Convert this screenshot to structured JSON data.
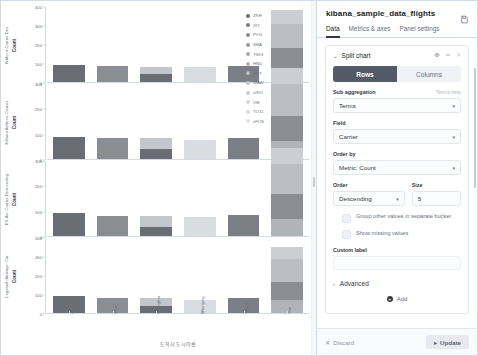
{
  "editor": {
    "title": "kibana_sample_data_flights",
    "save_icon": "save-icon",
    "tabs": [
      {
        "label": "Data",
        "selected": true
      },
      {
        "label": "Metrics & axes",
        "selected": false
      },
      {
        "label": "Panel settings",
        "selected": false
      }
    ],
    "agg": {
      "chevron": "⌄",
      "title": "Split chart",
      "eye_icon": "eye-icon",
      "drag_icon": "drag-handle-icon",
      "close_icon": "close-icon",
      "toggle": {
        "rows": "Rows",
        "columns": "Columns",
        "selected": "Rows"
      },
      "sub_aggregation": {
        "label": "Sub aggregation",
        "help": "Terms help",
        "value": "Terms"
      },
      "field": {
        "label": "Field",
        "value": "Carrier"
      },
      "order_by": {
        "label": "Order by",
        "value": "Metric: Count"
      },
      "order": {
        "label": "Order",
        "value": "Descending"
      },
      "size": {
        "label": "Size",
        "value": "5"
      },
      "group_other": "Group other values in separate bucket",
      "show_missing": "Show missing values",
      "custom_label": "Custom label",
      "custom_label_value": "",
      "advanced": "Advanced",
      "add": "Add"
    },
    "footer": {
      "discard": "Discard",
      "update": "Update"
    }
  },
  "chart_data": {
    "type": "bar",
    "title": "",
    "stacked": true,
    "grid": false,
    "legend_position": "right",
    "xlabel": "도착지 도시이름",
    "ylabel": "Count",
    "categories": [
      "Zurich",
      "Xi'an",
      "Shanghai",
      "Winnipeg",
      "Tokyo",
      "Yee"
    ],
    "legend": [
      {
        "label": "ZRH",
        "color": "#6a6d74"
      },
      {
        "label": "XIY",
        "color": "#7b7e85"
      },
      {
        "label": "PVG",
        "color": "#8a8d94"
      },
      {
        "label": "SHA",
        "color": "#989ba2"
      },
      {
        "label": "YWG",
        "color": "#a5a8af"
      },
      {
        "label": "HND",
        "color": "#b0b3b9"
      },
      {
        "label": "NRT",
        "color": "#babdc3"
      },
      {
        "label": "WAW",
        "color": "#c3c6cb"
      },
      {
        "label": "vRIO",
        "color": "#cbced3"
      },
      {
        "label": "VIE",
        "color": "#d2d5da"
      },
      {
        "label": "TO11",
        "color": "#d9dce0"
      },
      {
        "label": "vFOS",
        "color": "#e0e3e7"
      }
    ],
    "panels": [
      {
        "ytitle": "Without Carrier Des",
        "ylabel": "Count",
        "ylim": [
          0,
          400
        ],
        "yticks": [
          0,
          100,
          200,
          300,
          400
        ],
        "series": [
          {
            "name": "ES-Air",
            "stacks": [
              [
                95,
                "#6a6d74"
              ]
            ]
          },
          {
            "name": "Kibana Airlines",
            "stacks": [
              [
                88,
                "#8a8d94"
              ]
            ]
          },
          {
            "name": "Logstash Airways",
            "stacks": [
              [
                45,
                "#6a6d74"
              ],
              [
                40,
                "#c3c6cb"
              ]
            ]
          },
          {
            "name": "JetBeats",
            "stacks": [
              [
                82,
                "#d9dce0"
              ]
            ]
          },
          {
            "name": "ES-Air 2",
            "stacks": [
              [
                90,
                "#7b7e85"
              ]
            ]
          },
          {
            "name": "All",
            "stacks": [
              [
                78,
                "#b0b3b9"
              ],
              [
                105,
                "#8a8d94"
              ],
              [
                130,
                "#babdc3"
              ],
              [
                70,
                "#cbced3"
              ]
            ]
          }
        ]
      },
      {
        "ytitle": "Kibana Airlines: Carrier",
        "ylabel": "Count",
        "ylim": [
          0,
          300
        ],
        "yticks": [
          0,
          100,
          200,
          300
        ],
        "series": [
          {
            "name": "ES-Air",
            "stacks": [
              [
                92,
                "#6a6d74"
              ]
            ]
          },
          {
            "name": "Kibana Airlines",
            "stacks": [
              [
                86,
                "#8a8d94"
              ]
            ]
          },
          {
            "name": "Logstash Airways",
            "stacks": [
              [
                44,
                "#6a6d74"
              ],
              [
                42,
                "#c3c6cb"
              ]
            ]
          },
          {
            "name": "JetBeats",
            "stacks": [
              [
                80,
                "#d9dce0"
              ]
            ]
          },
          {
            "name": "ES-Air 2",
            "stacks": [
              [
                88,
                "#7b7e85"
              ]
            ]
          },
          {
            "name": "All",
            "stacks": [
              [
                74,
                "#b0b3b9"
              ],
              [
                100,
                "#8a8d94"
              ],
              [
                125,
                "#babdc3"
              ],
              [
                66,
                "#cbced3"
              ]
            ]
          }
        ]
      },
      {
        "ytitle": "ES-Air: Carrier Descending",
        "ylabel": "Count",
        "ylim": [
          0,
          300
        ],
        "yticks": [
          0,
          100,
          200,
          300
        ],
        "series": [
          {
            "name": "ES-Air",
            "stacks": [
              [
                96,
                "#6a6d74"
              ]
            ]
          },
          {
            "name": "Kibana Airlines",
            "stacks": [
              [
                84,
                "#8a8d94"
              ]
            ]
          },
          {
            "name": "Logstash Airways",
            "stacks": [
              [
                40,
                "#6a6d74"
              ],
              [
                44,
                "#c3c6cb"
              ]
            ]
          },
          {
            "name": "JetBeats",
            "stacks": [
              [
                78,
                "#d9dce0"
              ]
            ]
          },
          {
            "name": "ES-Air 2",
            "stacks": [
              [
                86,
                "#7b7e85"
              ]
            ]
          },
          {
            "name": "All",
            "stacks": [
              [
                70,
                "#b0b3b9"
              ],
              [
                98,
                "#8a8d94"
              ],
              [
                120,
                "#babdc3"
              ],
              [
                64,
                "#cbced3"
              ]
            ]
          }
        ]
      },
      {
        "ytitle": "Logstash Airways: Car",
        "ylabel": "Count",
        "ylim": [
          0,
          400
        ],
        "yticks": [
          0,
          100,
          200,
          300,
          400
        ],
        "series": [
          {
            "name": "ES-Air",
            "stacks": [
              [
                94,
                "#6a6d74"
              ]
            ]
          },
          {
            "name": "Kibana Airlines",
            "stacks": [
              [
                82,
                "#8a8d94"
              ]
            ]
          },
          {
            "name": "Logstash Airways",
            "stacks": [
              [
                42,
                "#6a6d74"
              ],
              [
                40,
                "#c3c6cb"
              ]
            ]
          },
          {
            "name": "JetBeats",
            "stacks": [
              [
                76,
                "#d9dce0"
              ]
            ]
          },
          {
            "name": "ES-Air 2",
            "stacks": [
              [
                84,
                "#7b7e85"
              ]
            ]
          },
          {
            "name": "All",
            "stacks": [
              [
                72,
                "#b0b3b9"
              ],
              [
                96,
                "#8a8d94"
              ],
              [
                122,
                "#babdc3"
              ],
              [
                62,
                "#cbced3"
              ]
            ]
          }
        ]
      }
    ]
  }
}
